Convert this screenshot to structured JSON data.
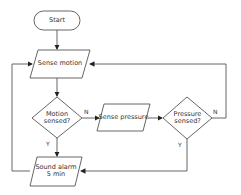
{
  "flowchart": {
    "nodes": {
      "start": {
        "type": "terminator",
        "label": "Start"
      },
      "sense_motion": {
        "type": "io",
        "label": "Sense motion"
      },
      "motion_sensed": {
        "type": "decision",
        "line1": "Motion",
        "line2": "sensed?"
      },
      "sense_pressure": {
        "type": "io",
        "label": "Sense pressure"
      },
      "pressure_sensed": {
        "type": "decision",
        "line1": "Pressure",
        "line2": "sensed?"
      },
      "sound_alarm": {
        "type": "io",
        "line1": "Sound alarm",
        "line2": "5 min"
      }
    },
    "edges": {
      "motion_no": "N",
      "motion_yes": "Y",
      "pressure_no": "N",
      "pressure_yes": "Y"
    },
    "colors": {
      "stroke": "#555555",
      "fill": "#ffffff",
      "text": "#333333"
    }
  }
}
